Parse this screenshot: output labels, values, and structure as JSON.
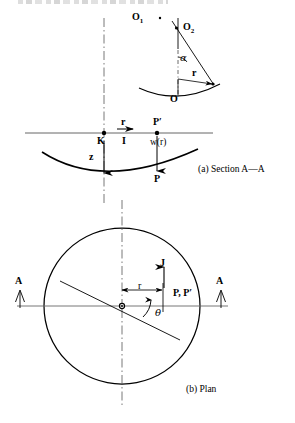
{
  "figure": {
    "captions": {
      "section": "(a) Section A—A",
      "plan": "(b) Plan"
    }
  },
  "inset": {
    "labels": {
      "o1": "O",
      "o1_sub": "1",
      "o2": "O",
      "o2_sub": "2",
      "o_origin": "O",
      "alpha": "α",
      "radius": "r"
    }
  },
  "section": {
    "labels": {
      "k_point": "K",
      "p_prime": "P′",
      "p_point": "P",
      "radius": "r",
      "unit_vector": "I",
      "deflection": "w(r)",
      "axis_z": "z"
    }
  },
  "plan": {
    "labels": {
      "section_mark_left": "A",
      "section_mark_right": "A",
      "vector_j": "J",
      "radius": "r",
      "theta": "θ",
      "point_pair": "P, P′"
    }
  },
  "colors": {
    "ink": "#000000",
    "background": "#ffffff",
    "thin_rule": "#555555",
    "centerline": "#666666"
  }
}
